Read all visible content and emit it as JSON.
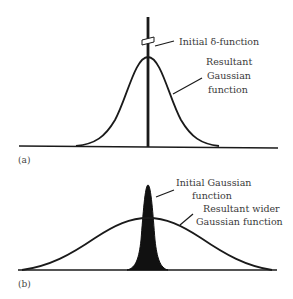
{
  "panel_a": {
    "label": "(a)",
    "annotations": {
      "delta": "Initial δ-function",
      "gaussian_line1": "Resultant",
      "gaussian_line2": "Gaussian",
      "gaussian_line3": "function"
    }
  },
  "panel_b": {
    "label": "(b)",
    "annotations": {
      "initial_line1": "Initial Gaussian",
      "initial_line2": "function",
      "wider_line1": "Resultant wider",
      "wider_line2": "Gaussian function"
    }
  },
  "colors": {
    "stroke": "#1a1a1a",
    "fill": "#111111",
    "text": "#3a3a3a"
  }
}
